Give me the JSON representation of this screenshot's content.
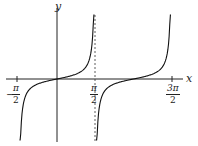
{
  "chart_data": {
    "type": "line",
    "title": "",
    "function": "y = tan(x)",
    "xlabel": "x",
    "ylabel": "y",
    "x_ticks": [
      {
        "value": "-π/2",
        "num": "π",
        "den": "2",
        "sign": "−"
      },
      {
        "value": "π/2",
        "num": "π",
        "den": "2",
        "sign": ""
      },
      {
        "value": "3π/2",
        "num": "3π",
        "den": "2",
        "sign": ""
      }
    ],
    "asymptotes": [
      {
        "x": "π/2",
        "style": "dashed"
      }
    ],
    "xlim": [
      "-π/2",
      "3π/2"
    ],
    "grid": false,
    "legend": null,
    "series": [
      {
        "name": "tan x branch 1",
        "domain": [
          "-π/2",
          "π/2"
        ]
      },
      {
        "name": "tan x branch 2",
        "domain": [
          "π/2",
          "3π/2"
        ]
      }
    ]
  },
  "axes": {
    "x_label": "x",
    "y_label": "y"
  }
}
